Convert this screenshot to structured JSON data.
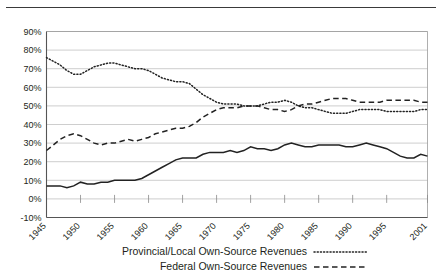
{
  "chart_data": {
    "type": "line",
    "title": "",
    "xlabel": "",
    "ylabel": "",
    "ylim": [
      -10,
      90
    ],
    "ytick_labels": [
      "90%",
      "80%",
      "70%",
      "60%",
      "50%",
      "40%",
      "30%",
      "20%",
      "10%",
      "0%",
      "-10%"
    ],
    "ytick_values": [
      90,
      80,
      70,
      60,
      50,
      40,
      30,
      20,
      10,
      0,
      -10
    ],
    "grid": true,
    "legend_position": "bottom",
    "xlim": [
      1945,
      2001
    ],
    "xtick_labels": [
      "1945",
      "1950",
      "1955",
      "1960",
      "1965",
      "1970",
      "1975",
      "1980",
      "1985",
      "1990",
      "1995",
      "2001"
    ],
    "xtick_values": [
      1945,
      1950,
      1955,
      1960,
      1965,
      1970,
      1975,
      1980,
      1985,
      1990,
      1995,
      2001
    ],
    "x": [
      1945,
      1946,
      1947,
      1948,
      1949,
      1950,
      1951,
      1952,
      1953,
      1954,
      1955,
      1956,
      1957,
      1958,
      1959,
      1960,
      1961,
      1962,
      1963,
      1964,
      1965,
      1966,
      1967,
      1968,
      1969,
      1970,
      1971,
      1972,
      1973,
      1974,
      1975,
      1976,
      1977,
      1978,
      1979,
      1980,
      1981,
      1982,
      1983,
      1984,
      1985,
      1986,
      1987,
      1988,
      1989,
      1990,
      1991,
      1992,
      1993,
      1994,
      1995,
      1996,
      1997,
      1998,
      1999,
      2000,
      2001
    ],
    "series": [
      {
        "name": "Provincial/Local Own-Source Revenues",
        "style": "dotted",
        "values": [
          76,
          74,
          72,
          69,
          67,
          67,
          69,
          71,
          72,
          73,
          73,
          72,
          71,
          70,
          70,
          69,
          67,
          65,
          64,
          63,
          63,
          62,
          59,
          56,
          54,
          52,
          51,
          51,
          51,
          50,
          50,
          50,
          51,
          52,
          52,
          53,
          52,
          50,
          49,
          49,
          48,
          47,
          46,
          46,
          46,
          47,
          48,
          48,
          48,
          48,
          47,
          47,
          47,
          47,
          47,
          48,
          48
        ]
      },
      {
        "name": "Federal Own-Source Revenues",
        "style": "dashed",
        "values": [
          26,
          29,
          32,
          34,
          35,
          34,
          32,
          30,
          29,
          30,
          30,
          31,
          32,
          31,
          32,
          33,
          35,
          36,
          37,
          38,
          38,
          39,
          41,
          44,
          46,
          48,
          49,
          49,
          49,
          50,
          50,
          50,
          49,
          48,
          48,
          47,
          48,
          50,
          51,
          51,
          52,
          53,
          54,
          54,
          54,
          53,
          52,
          52,
          52,
          52,
          53,
          53,
          53,
          53,
          53,
          52,
          52
        ]
      },
      {
        "name": "",
        "style": "solid",
        "values": [
          7,
          7,
          7,
          6,
          7,
          9,
          8,
          8,
          9,
          9,
          10,
          10,
          10,
          10,
          11,
          13,
          15,
          17,
          19,
          21,
          22,
          22,
          22,
          24,
          25,
          25,
          25,
          26,
          25,
          26,
          28,
          27,
          27,
          26,
          27,
          29,
          30,
          29,
          28,
          28,
          29,
          29,
          29,
          29,
          28,
          28,
          29,
          30,
          29,
          28,
          27,
          25,
          23,
          22,
          22,
          24,
          23
        ]
      }
    ],
    "legend": [
      {
        "label": "Provincial/Local Own-Source Revenues",
        "style": "dotted"
      },
      {
        "label": "Federal Own-Source Revenues",
        "style": "dashed"
      }
    ]
  }
}
